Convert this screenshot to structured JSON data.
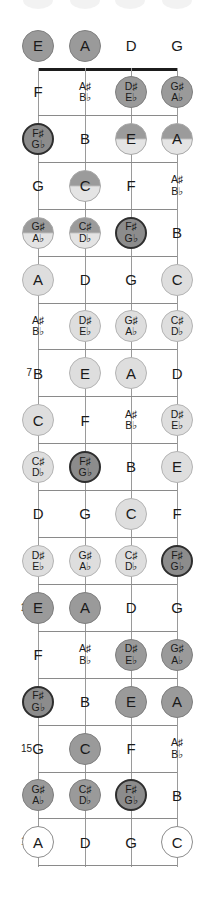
{
  "diagram": {
    "instrument": "4-string bass",
    "open_strings": [
      "E",
      "A",
      "D",
      "G"
    ],
    "fret_range": [
      0,
      17
    ],
    "marked_frets": [
      "5",
      "7",
      "9",
      "12",
      "15",
      "17"
    ],
    "colors": {
      "nut": "#1c1c1c",
      "fret": "#8a8a8a",
      "string": "#9a9a9a",
      "text": "#1a1a1a",
      "disc_root": "#8c8c8c",
      "disc_natural": "#dedede",
      "disc_open": "#ffffff"
    }
  },
  "chart_data": {
    "type": "table",
    "xlabel": "String",
    "ylabel": "Fret",
    "categories": [
      "E",
      "A",
      "D",
      "G"
    ],
    "grid": true,
    "legend": "none",
    "frets": [
      {
        "number": "0",
        "label": "",
        "notes": [
          {
            "text": "E",
            "sharp": "",
            "flat": "",
            "style": "mid"
          },
          {
            "text": "A",
            "sharp": "",
            "flat": "",
            "style": "mid"
          },
          {
            "text": "D",
            "sharp": "",
            "flat": "",
            "style": "none"
          },
          {
            "text": "G",
            "sharp": "",
            "flat": "",
            "style": "none"
          }
        ]
      },
      {
        "number": "1",
        "label": "",
        "notes": [
          {
            "text": "F",
            "sharp": "",
            "flat": "",
            "style": "none"
          },
          {
            "text": "",
            "sharp": "A♯",
            "flat": "B♭",
            "style": "none"
          },
          {
            "text": "",
            "sharp": "D♯",
            "flat": "E♭",
            "style": "mid"
          },
          {
            "text": "",
            "sharp": "G♯",
            "flat": "A♭",
            "style": "mid"
          }
        ]
      },
      {
        "number": "2",
        "label": "",
        "notes": [
          {
            "text": "",
            "sharp": "F♯",
            "flat": "G♭",
            "style": "dark"
          },
          {
            "text": "B",
            "sharp": "",
            "flat": "",
            "style": "none"
          },
          {
            "text": "E",
            "sharp": "",
            "flat": "",
            "style": "grad"
          },
          {
            "text": "A",
            "sharp": "",
            "flat": "",
            "style": "grad"
          }
        ]
      },
      {
        "number": "3",
        "label": "",
        "notes": [
          {
            "text": "G",
            "sharp": "",
            "flat": "",
            "style": "none"
          },
          {
            "text": "C",
            "sharp": "",
            "flat": "",
            "style": "grad"
          },
          {
            "text": "F",
            "sharp": "",
            "flat": "",
            "style": "none"
          },
          {
            "text": "",
            "sharp": "A♯",
            "flat": "B♭",
            "style": "none"
          }
        ]
      },
      {
        "number": "4",
        "label": "",
        "notes": [
          {
            "text": "",
            "sharp": "G♯",
            "flat": "A♭",
            "style": "grad"
          },
          {
            "text": "",
            "sharp": "C♯",
            "flat": "D♭",
            "style": "grad"
          },
          {
            "text": "",
            "sharp": "F♯",
            "flat": "G♭",
            "style": "dark"
          },
          {
            "text": "B",
            "sharp": "",
            "flat": "",
            "style": "none"
          }
        ]
      },
      {
        "number": "5",
        "label": "5",
        "notes": [
          {
            "text": "A",
            "sharp": "",
            "flat": "",
            "style": "light"
          },
          {
            "text": "D",
            "sharp": "",
            "flat": "",
            "style": "none"
          },
          {
            "text": "G",
            "sharp": "",
            "flat": "",
            "style": "none"
          },
          {
            "text": "C",
            "sharp": "",
            "flat": "",
            "style": "light"
          }
        ]
      },
      {
        "number": "6",
        "label": "",
        "notes": [
          {
            "text": "",
            "sharp": "A♯",
            "flat": "B♭",
            "style": "none"
          },
          {
            "text": "",
            "sharp": "D♯",
            "flat": "E♭",
            "style": "light"
          },
          {
            "text": "",
            "sharp": "G♯",
            "flat": "A♭",
            "style": "light"
          },
          {
            "text": "",
            "sharp": "C♯",
            "flat": "D♭",
            "style": "light"
          }
        ]
      },
      {
        "number": "7",
        "label": "7",
        "notes": [
          {
            "text": "B",
            "sharp": "",
            "flat": "",
            "style": "none"
          },
          {
            "text": "E",
            "sharp": "",
            "flat": "",
            "style": "light"
          },
          {
            "text": "A",
            "sharp": "",
            "flat": "",
            "style": "light"
          },
          {
            "text": "D",
            "sharp": "",
            "flat": "",
            "style": "none"
          }
        ]
      },
      {
        "number": "8",
        "label": "",
        "notes": [
          {
            "text": "C",
            "sharp": "",
            "flat": "",
            "style": "light"
          },
          {
            "text": "F",
            "sharp": "",
            "flat": "",
            "style": "none"
          },
          {
            "text": "",
            "sharp": "A♯",
            "flat": "B♭",
            "style": "none"
          },
          {
            "text": "",
            "sharp": "D♯",
            "flat": "E♭",
            "style": "light"
          }
        ]
      },
      {
        "number": "9",
        "label": "9",
        "notes": [
          {
            "text": "",
            "sharp": "C♯",
            "flat": "D♭",
            "style": "light"
          },
          {
            "text": "",
            "sharp": "F♯",
            "flat": "G♭",
            "style": "dark"
          },
          {
            "text": "B",
            "sharp": "",
            "flat": "",
            "style": "none"
          },
          {
            "text": "E",
            "sharp": "",
            "flat": "",
            "style": "light"
          }
        ]
      },
      {
        "number": "10",
        "label": "",
        "notes": [
          {
            "text": "D",
            "sharp": "",
            "flat": "",
            "style": "none"
          },
          {
            "text": "G",
            "sharp": "",
            "flat": "",
            "style": "none"
          },
          {
            "text": "C",
            "sharp": "",
            "flat": "",
            "style": "light"
          },
          {
            "text": "F",
            "sharp": "",
            "flat": "",
            "style": "none"
          }
        ]
      },
      {
        "number": "11",
        "label": "",
        "notes": [
          {
            "text": "",
            "sharp": "D♯",
            "flat": "E♭",
            "style": "light"
          },
          {
            "text": "",
            "sharp": "G♯",
            "flat": "A♭",
            "style": "light"
          },
          {
            "text": "",
            "sharp": "C♯",
            "flat": "D♭",
            "style": "light"
          },
          {
            "text": "",
            "sharp": "F♯",
            "flat": "G♭",
            "style": "dark"
          }
        ]
      },
      {
        "number": "12",
        "label": "12",
        "notes": [
          {
            "text": "E",
            "sharp": "",
            "flat": "",
            "style": "mid"
          },
          {
            "text": "A",
            "sharp": "",
            "flat": "",
            "style": "mid"
          },
          {
            "text": "D",
            "sharp": "",
            "flat": "",
            "style": "none"
          },
          {
            "text": "G",
            "sharp": "",
            "flat": "",
            "style": "none"
          }
        ]
      },
      {
        "number": "13",
        "label": "",
        "notes": [
          {
            "text": "F",
            "sharp": "",
            "flat": "",
            "style": "none"
          },
          {
            "text": "",
            "sharp": "A♯",
            "flat": "B♭",
            "style": "none"
          },
          {
            "text": "",
            "sharp": "D♯",
            "flat": "E♭",
            "style": "mid"
          },
          {
            "text": "",
            "sharp": "G♯",
            "flat": "A♭",
            "style": "mid"
          }
        ]
      },
      {
        "number": "14",
        "label": "",
        "notes": [
          {
            "text": "",
            "sharp": "F♯",
            "flat": "G♭",
            "style": "dark"
          },
          {
            "text": "B",
            "sharp": "",
            "flat": "",
            "style": "none"
          },
          {
            "text": "E",
            "sharp": "",
            "flat": "",
            "style": "mid"
          },
          {
            "text": "A",
            "sharp": "",
            "flat": "",
            "style": "mid"
          }
        ]
      },
      {
        "number": "15",
        "label": "15",
        "notes": [
          {
            "text": "G",
            "sharp": "",
            "flat": "",
            "style": "none"
          },
          {
            "text": "C",
            "sharp": "",
            "flat": "",
            "style": "mid"
          },
          {
            "text": "F",
            "sharp": "",
            "flat": "",
            "style": "none"
          },
          {
            "text": "",
            "sharp": "A♯",
            "flat": "B♭",
            "style": "none"
          }
        ]
      },
      {
        "number": "16",
        "label": "",
        "notes": [
          {
            "text": "",
            "sharp": "G♯",
            "flat": "A♭",
            "style": "mid"
          },
          {
            "text": "",
            "sharp": "C♯",
            "flat": "D♭",
            "style": "mid"
          },
          {
            "text": "",
            "sharp": "F♯",
            "flat": "G♭",
            "style": "dark"
          },
          {
            "text": "B",
            "sharp": "",
            "flat": "",
            "style": "none"
          }
        ]
      },
      {
        "number": "17",
        "label": "17",
        "notes": [
          {
            "text": "A",
            "sharp": "",
            "flat": "",
            "style": "white"
          },
          {
            "text": "D",
            "sharp": "",
            "flat": "",
            "style": "none"
          },
          {
            "text": "G",
            "sharp": "",
            "flat": "",
            "style": "none"
          },
          {
            "text": "C",
            "sharp": "",
            "flat": "",
            "style": "white"
          }
        ]
      }
    ]
  }
}
